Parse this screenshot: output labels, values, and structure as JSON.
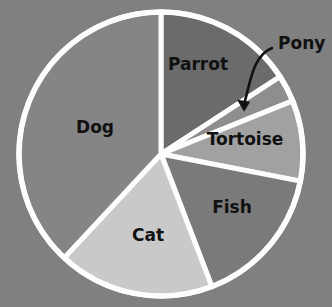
{
  "chart_data": {
    "type": "pie",
    "title": "",
    "subtitle": "",
    "xlabel": "",
    "ylabel": "",
    "legend_position": "none",
    "grid": false,
    "background_color": "#808080",
    "wedge_edge_color": "#fdfdfd",
    "label_color": "#111111",
    "start_angle_deg": 0,
    "direction": "clockwise",
    "categories": [
      "Parrot",
      "Pony",
      "Tortoise",
      "Fish",
      "Cat",
      "Dog"
    ],
    "values": [
      15.8,
      3.1,
      9.2,
      16.1,
      17.8,
      38.0
    ],
    "unit": "percent",
    "slices": [
      {
        "label": "Parrot",
        "value": 15.8,
        "start_deg": 0.0,
        "end_deg": 57.0,
        "color": "#6b6b6b",
        "label_x": 198,
        "label_y": 65,
        "callout": false
      },
      {
        "label": "Pony",
        "value": 3.1,
        "start_deg": 57.0,
        "end_deg": 68.0,
        "color": "#8e8e8e",
        "label_x": 278,
        "label_y": 44,
        "callout": true
      },
      {
        "label": "Tortoise",
        "value": 9.2,
        "start_deg": 68.0,
        "end_deg": 101.0,
        "color": "#a1a1a1",
        "label_x": 245,
        "label_y": 140,
        "callout": false
      },
      {
        "label": "Fish",
        "value": 16.1,
        "start_deg": 101.0,
        "end_deg": 159.0,
        "color": "#7a7a7a",
        "label_x": 232,
        "label_y": 208,
        "callout": false
      },
      {
        "label": "Cat",
        "value": 17.8,
        "start_deg": 159.0,
        "end_deg": 223.0,
        "color": "#c9c9c9",
        "label_x": 148,
        "label_y": 236,
        "callout": false
      },
      {
        "label": "Dog",
        "value": 38.0,
        "start_deg": 223.0,
        "end_deg": 360.0,
        "color": "#858585",
        "label_x": 95,
        "label_y": 128,
        "callout": false
      }
    ],
    "geometry": {
      "center_x": 161,
      "center_y": 154,
      "radius": 142
    },
    "annotations": [
      {
        "name": "pony-callout-arrow",
        "text": "Pony",
        "points_to_slice": "Pony"
      }
    ]
  }
}
